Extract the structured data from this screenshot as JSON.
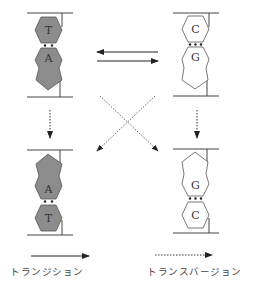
{
  "pairs": {
    "top_left": {
      "top_base": "T",
      "bottom_base": "A",
      "fill": "#8c8c8c"
    },
    "top_right": {
      "top_base": "C",
      "bottom_base": "G",
      "fill": "#ffffff"
    },
    "bottom_left": {
      "top_base": "A",
      "bottom_base": "T",
      "fill": "#8c8c8c"
    },
    "bottom_right": {
      "top_base": "G",
      "bottom_base": "C",
      "fill": "#ffffff"
    }
  },
  "legend": {
    "solid_arrow_label": "トランジション",
    "dotted_arrow_label": "トランスバージョン"
  },
  "colors": {
    "purine_pyrimidine_fill_AT": "#8c8c8c",
    "purine_pyrimidine_fill_GC": "#ffffff",
    "line": "#333333"
  }
}
